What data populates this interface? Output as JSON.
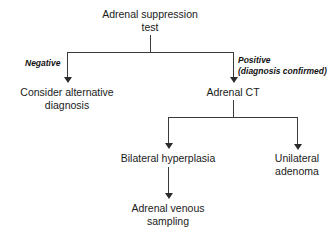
{
  "diagram": {
    "type": "flowchart",
    "title": "Adrenal suppression test",
    "orientation": "top-down",
    "nodes": {
      "root": {
        "label": "Adrenal suppression\ntest",
        "line1": "Adrenal suppression",
        "line2": "test"
      },
      "negative_outcome": {
        "line1": "Consider alternative",
        "line2": "diagnosis"
      },
      "positive_outcome": {
        "line1": "Adrenal CT",
        "line2": ""
      },
      "bilateral": {
        "line1": "Bilateral hyperplasia",
        "line2": ""
      },
      "unilateral": {
        "line1": "Unilateral",
        "line2": "adenoma"
      },
      "avs": {
        "line1": "Adrenal venous",
        "line2": "sampling"
      }
    },
    "edge_labels": {
      "negative": {
        "line1": "Negative",
        "line2": ""
      },
      "positive": {
        "line1": "Positive",
        "line2": "(diagnosis confirmed)"
      }
    },
    "colors": {
      "line": "#3a3a3a",
      "arrow": "#2b2b2b",
      "text": "#1a1a1a",
      "background": "#ffffff"
    }
  }
}
